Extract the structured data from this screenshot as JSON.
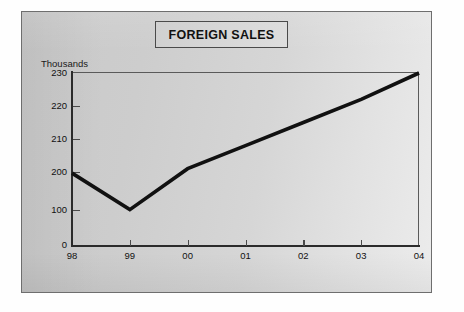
{
  "title": {
    "text": "FOREIGN SALES"
  },
  "chart_data": {
    "type": "line",
    "title": "FOREIGN SALES",
    "xlabel": "",
    "ylabel": "Thousands",
    "unit_caption": "Thousands",
    "categories": [
      "98",
      "99",
      "00",
      "01",
      "02",
      "03",
      "04"
    ],
    "series": [
      {
        "name": "Foreign Sales",
        "values": [
          197,
          101,
          201,
          208,
          215,
          222,
          230
        ],
        "color": "#111111",
        "line_width": 3.6
      }
    ],
    "y_ticks": [
      0,
      100,
      200,
      210,
      220,
      230
    ],
    "y_tick_labels": [
      "0",
      "100",
      "200",
      "210",
      "220",
      "230"
    ],
    "y_axis_note": "non-linear axis: 0 and 100 compressed, 200-230 expanded",
    "ylim": [
      0,
      230
    ],
    "grid": false,
    "legend": false,
    "legend_position": "none"
  },
  "colors": {
    "panel_dark": "#c9c9c9",
    "panel_light": "#ececec",
    "line": "#111111",
    "axis": "#2b2b2b",
    "frame": "#5a5a5a",
    "text": "#111111",
    "page": "#ffffff"
  }
}
